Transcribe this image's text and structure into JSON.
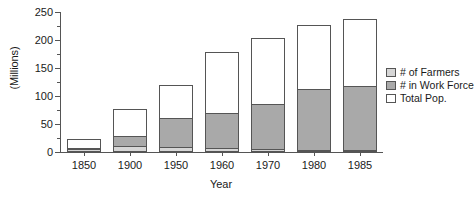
{
  "chart_data": {
    "type": "bar",
    "subtype": "stacked-bar",
    "title": "",
    "xlabel": "Year",
    "ylabel": "(Millions)",
    "ylim": [
      0,
      250
    ],
    "ytick_step": 50,
    "yminor_step": 25,
    "grid": false,
    "legend_position": "right",
    "categories": [
      "1850",
      "1900",
      "1950",
      "1960",
      "1970",
      "1980",
      "1985"
    ],
    "ytick_labels": [
      "0",
      "50",
      "100",
      "150",
      "200",
      "250"
    ],
    "series": [
      {
        "name": "# of Farmers",
        "color": "#d6d6d6",
        "values": [
          5,
          11,
          9,
          7,
          5,
          4,
          4
        ]
      },
      {
        "name": "# in Work Force",
        "color": "#a9a9a9",
        "values": [
          8,
          29,
          60,
          70,
          85,
          112,
          117
        ]
      },
      {
        "name": "Total Pop.",
        "color": "#ffffff",
        "values": [
          23,
          76,
          120,
          179,
          203,
          227,
          238
        ]
      }
    ],
    "annotations": []
  },
  "legend": {
    "items": [
      {
        "label": "# of Farmers",
        "swatch": "#d6d6d6"
      },
      {
        "label": "# in Work Force",
        "swatch": "#a9a9a9"
      },
      {
        "label": "Total Pop.",
        "swatch": "#ffffff"
      }
    ]
  },
  "colors": {
    "axis": "#555555",
    "farmers": "#d6d6d6",
    "workforce": "#a9a9a9",
    "total": "#ffffff",
    "text": "#1a1a1a"
  }
}
